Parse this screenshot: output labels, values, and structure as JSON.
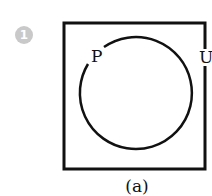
{
  "badge": {
    "number": "1",
    "color": "#c9c9c9"
  },
  "diagram": {
    "type": "venn",
    "universal_set_label": "U",
    "set_label": "P",
    "caption": "(a)",
    "stroke_color": "#111111"
  }
}
